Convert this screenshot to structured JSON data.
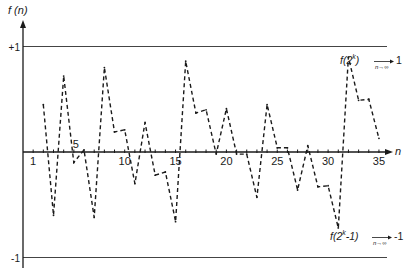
{
  "chart_data": {
    "type": "line",
    "title": "",
    "ylabel": "f (n)",
    "xlabel": "n",
    "xlim": [
      0,
      36.5
    ],
    "ylim": [
      -1,
      1
    ],
    "x_tick_labels": [
      "1",
      "5",
      "10",
      "15",
      "20",
      "25",
      "30",
      "35"
    ],
    "x_tick_label_values": [
      1,
      5,
      10,
      15,
      20,
      25,
      30,
      35
    ],
    "x_minor_ticks": [
      1,
      2,
      3,
      4,
      5,
      6,
      7,
      8,
      9,
      10,
      11,
      12,
      13,
      14,
      15,
      16,
      17,
      18,
      19,
      20,
      21,
      22,
      23,
      24,
      25,
      26,
      27,
      28,
      29,
      30,
      31,
      32,
      33,
      34,
      35
    ],
    "y_tick_labels": [
      "+1",
      "-1"
    ],
    "y_tick_values": [
      1,
      -1
    ],
    "reference_lines": [
      {
        "name": "upper-limit",
        "y": 1
      },
      {
        "name": "lower-limit",
        "y": -1
      }
    ],
    "annotations": [
      {
        "name": "upper-limit-annotation",
        "text_main": "f(2",
        "text_sup": "k",
        "text_close": ")",
        "text_under": "n→∞",
        "text_value": "1",
        "anchor_y": 1
      },
      {
        "name": "lower-limit-annotation",
        "text_main": "f(2",
        "text_sup": "k",
        "text_close": "-1)",
        "text_under": "n→∞",
        "text_value": "-1",
        "anchor_y": -1
      }
    ],
    "series": [
      {
        "name": "f(n)",
        "style": "dashed",
        "x": [
          2,
          3,
          4,
          5,
          6,
          7,
          8,
          9,
          10,
          11,
          12,
          13,
          14,
          15,
          16,
          17,
          18,
          19,
          20,
          21,
          22,
          23,
          24,
          25,
          26,
          27,
          28,
          29,
          30,
          31,
          32,
          33,
          34,
          35
        ],
        "y": [
          0.45,
          -0.6,
          0.72,
          -0.1,
          0.02,
          -0.62,
          0.8,
          0.19,
          0.21,
          -0.3,
          0.28,
          -0.22,
          -0.19,
          -0.66,
          0.86,
          0.37,
          0.4,
          -0.02,
          0.41,
          -0.02,
          -0.02,
          -0.43,
          0.45,
          0.04,
          0.04,
          -0.36,
          0.06,
          -0.33,
          -0.32,
          -0.72,
          0.9,
          0.49,
          0.5,
          0.13
        ]
      }
    ],
    "grid": false,
    "legend": "none"
  }
}
